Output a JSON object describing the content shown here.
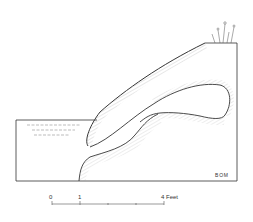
{
  "diagram": {
    "initials": "BOM",
    "scale_bar": {
      "labels": [
        "0",
        "1",
        "4 Feet"
      ],
      "tick_count": 5,
      "unit": "Feet"
    },
    "colors": {
      "ink": "#333333",
      "hatch": "#8a8a8a",
      "background": "#ffffff"
    }
  }
}
